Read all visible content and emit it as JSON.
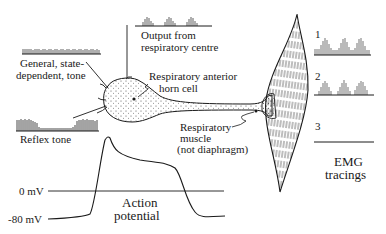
{
  "diagram": {
    "labels": {
      "general_tone": [
        "General, state-",
        "dependent, tone"
      ],
      "reflex_tone": "Reflex tone",
      "output_centre": [
        "Output from",
        "respiratory centre"
      ],
      "anterior_horn": [
        "Respiratory anterior",
        "horn cell"
      ],
      "muscle": [
        "Respiratory",
        "muscle",
        "(not diaphragm)"
      ],
      "action_potential": [
        "Action",
        "potential"
      ],
      "emg": [
        "EMG",
        "tracings"
      ],
      "zero_mv": "0 mV",
      "minus80_mv": "-80 mV"
    },
    "emg_tracings": [
      {
        "index": "1",
        "description": "tonic baseline activity with three phasic bursts"
      },
      {
        "index": "2",
        "description": "three phasic bursts, no tonic activity"
      },
      {
        "index": "3",
        "description": "flat line, no activity"
      }
    ],
    "action_potential_axis": {
      "levels": [
        "0 mV",
        "-80 mV"
      ]
    },
    "colors": {
      "ink": "#1a1a1a",
      "background": "#ffffff"
    }
  }
}
